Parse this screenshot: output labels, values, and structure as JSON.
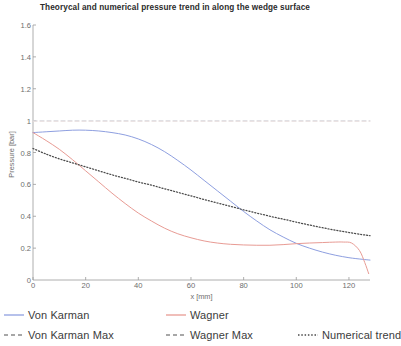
{
  "chart_data": {
    "type": "line",
    "title": "Theorycal and numerical pressure trend in along the wedge surface",
    "xlabel": "x [mm]",
    "ylabel": "Pressure [bar]",
    "xlim": [
      0,
      128
    ],
    "ylim": [
      0,
      1.6
    ],
    "xticks": [
      0,
      20,
      40,
      60,
      80,
      100,
      120
    ],
    "yticks": [
      0,
      0.2,
      0.4,
      0.6,
      0.8,
      1,
      1.2,
      1.4,
      1.6
    ],
    "grid": false,
    "legend_position": "below",
    "series": [
      {
        "name": "Von Karman",
        "color": "#8e9fe0",
        "style": "solid",
        "x": [
          0,
          5,
          10,
          15,
          20,
          25,
          30,
          35,
          40,
          45,
          50,
          55,
          60,
          65,
          70,
          75,
          80,
          85,
          90,
          95,
          100,
          105,
          110,
          115,
          120,
          125,
          128
        ],
        "y": [
          0.925,
          0.93,
          0.935,
          0.94,
          0.94,
          0.935,
          0.925,
          0.91,
          0.885,
          0.85,
          0.805,
          0.75,
          0.69,
          0.625,
          0.56,
          0.495,
          0.43,
          0.37,
          0.315,
          0.27,
          0.23,
          0.2,
          0.175,
          0.155,
          0.14,
          0.13,
          0.125
        ]
      },
      {
        "name": "Wagner",
        "color": "#e89b94",
        "style": "solid",
        "x": [
          0,
          5,
          10,
          15,
          20,
          25,
          30,
          35,
          40,
          45,
          50,
          55,
          60,
          65,
          70,
          75,
          80,
          85,
          90,
          95,
          100,
          105,
          110,
          115,
          118,
          121,
          124,
          126,
          127.5
        ],
        "y": [
          0.925,
          0.875,
          0.82,
          0.755,
          0.685,
          0.615,
          0.545,
          0.48,
          0.42,
          0.37,
          0.325,
          0.29,
          0.265,
          0.245,
          0.232,
          0.224,
          0.22,
          0.218,
          0.218,
          0.222,
          0.228,
          0.232,
          0.235,
          0.238,
          0.238,
          0.232,
          0.185,
          0.11,
          0.04
        ]
      },
      {
        "name": "Von Karman Max",
        "color": "#d9d9de",
        "style": "dashed",
        "x": [
          0,
          128
        ],
        "y": [
          1.0,
          1.0
        ]
      },
      {
        "name": "Wagner Max",
        "color": "#e6dcdc",
        "style": "dashed",
        "x": [
          0,
          128
        ],
        "y": [
          0.995,
          0.995
        ]
      },
      {
        "name": "Numerical trend",
        "color": "#4a4a4a",
        "style": "dotted",
        "x": [
          0,
          5,
          10,
          15,
          20,
          25,
          30,
          35,
          40,
          45,
          50,
          55,
          60,
          65,
          70,
          75,
          80,
          85,
          90,
          95,
          100,
          105,
          110,
          115,
          120,
          125,
          128
        ],
        "y": [
          0.825,
          0.79,
          0.76,
          0.735,
          0.71,
          0.685,
          0.66,
          0.638,
          0.615,
          0.595,
          0.572,
          0.55,
          0.528,
          0.505,
          0.483,
          0.462,
          0.44,
          0.42,
          0.4,
          0.382,
          0.363,
          0.345,
          0.328,
          0.312,
          0.298,
          0.285,
          0.278
        ]
      }
    ]
  },
  "legend": {
    "row1": [
      "Von Karman",
      "Wagner"
    ],
    "row2": [
      "Von Karman Max",
      "Wagner Max",
      "Numerical trend"
    ]
  }
}
